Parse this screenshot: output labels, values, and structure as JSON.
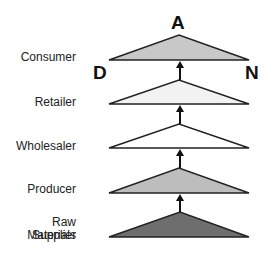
{
  "diagram": {
    "levels": [
      {
        "label": "Consumer",
        "fill": "#c8c8c8"
      },
      {
        "label": "Retailer",
        "fill": "#f2f2f2"
      },
      {
        "label": "Wholesaler",
        "fill": "#ffffff"
      },
      {
        "label": "Producer",
        "fill": "#bdbdbd"
      },
      {
        "label": "Raw Materials Supplier",
        "label_line1": "Raw Materials",
        "label_line2": "Supplier",
        "fill": "#6e6e6e"
      }
    ],
    "corner_labels": {
      "top": "A",
      "left": "D",
      "right": "N"
    },
    "arrow_direction": "up"
  }
}
